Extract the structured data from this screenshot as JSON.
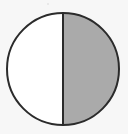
{
  "figure": {
    "name": "fraction-circle-one-half",
    "canvas": {
      "width": 128,
      "height": 134,
      "background_color": "#f7f7f7"
    },
    "shape": {
      "type": "circle",
      "center_x": 63,
      "center_y": 69,
      "radius": 56,
      "outline_color": "#2b2b2b",
      "outline_width": 2
    },
    "divider": {
      "type": "vertical-line",
      "x": 63,
      "y_start": 13,
      "y_end": 125,
      "color": "#2b2b2b",
      "width": 2
    },
    "parts": [
      {
        "label": "left-half",
        "side": "left",
        "shaded": false,
        "fill_color": "#ffffff"
      },
      {
        "label": "right-half",
        "side": "right",
        "shaded": true,
        "fill_color": "#aaaaaa"
      }
    ],
    "artifact": {
      "label": "scan-speck",
      "x": 47,
      "y": 3,
      "color": "#e4e4e4"
    }
  },
  "chart_data": {
    "type": "pie",
    "title": "",
    "xlabel": "",
    "ylabel": "",
    "categories": [
      "shaded",
      "unshaded"
    ],
    "values": [
      1,
      2
    ],
    "fractions": [
      "1/2",
      "1/2"
    ],
    "percentages": [
      50,
      50
    ],
    "colors": [
      "#aaaaaa",
      "#ffffff"
    ],
    "total_parts": 2,
    "shaded_parts": 1,
    "fraction_represented": "1/2",
    "start_angle_degrees": 0,
    "legend": "none",
    "grid": false,
    "labels_shown": false
  }
}
